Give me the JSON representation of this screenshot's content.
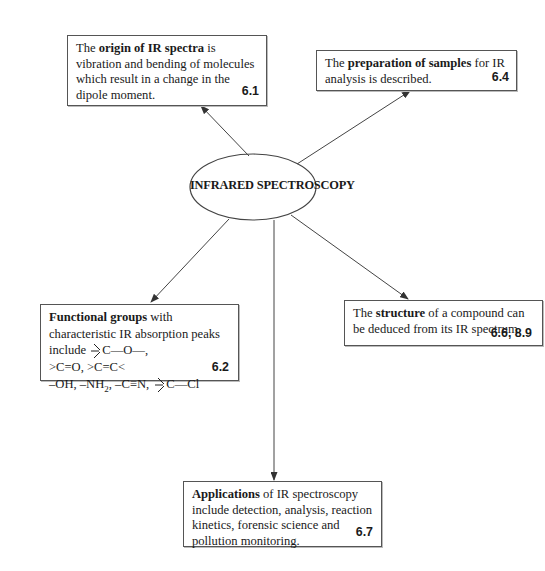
{
  "diagram": {
    "center": {
      "label": "INFRARED SPECTROSCOPY"
    },
    "boxes": {
      "origin": {
        "pre": "The ",
        "bold": "origin of IR spectra",
        "post": " is vibration and bending of molecules which result in a change in the dipole moment.",
        "ref": "6.1"
      },
      "preparation": {
        "pre": "The ",
        "bold": "preparation of samples",
        "post": " for IR analysis is described.",
        "ref": "6.4"
      },
      "functional_groups": {
        "bold": "Functional groups",
        "post": " with characteristic IR absorption peaks include",
        "formula1_tail": "C—O—,",
        "line2": ">C=O, >C=C<",
        "line3_a": "–OH, –NH",
        "line3_sub": "2",
        "line3_b": ", –C≡N,",
        "formula2_tail": "C—Cl",
        "ref": "6.2"
      },
      "structure": {
        "pre": "The ",
        "bold": "structure",
        "post": " of a compound can be deduced from its IR spectrum.",
        "ref": "6.6, 8.9"
      },
      "applications": {
        "bold": "Applications",
        "post": " of IR spectroscopy include detection, analysis, reaction kinetics, forensic science and pollution monitoring.",
        "ref": "6.7"
      }
    },
    "colors": {
      "line": "#444444",
      "border": "#555555",
      "text": "#1a1a1a"
    }
  }
}
